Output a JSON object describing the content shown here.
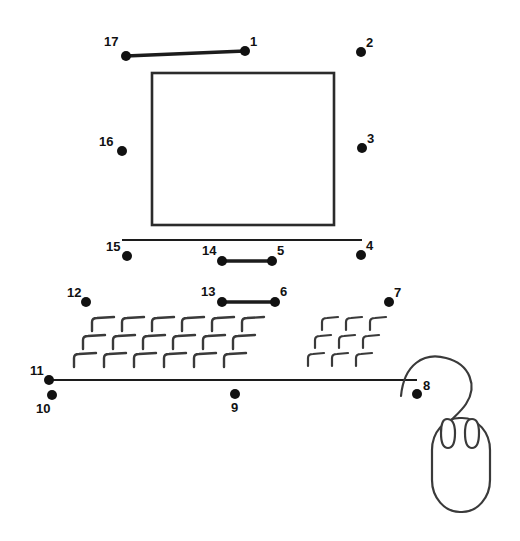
{
  "puzzle": {
    "type": "connect-the-dots",
    "subject": "desktop computer with monitor, keyboard and mouse",
    "dot_count": 17,
    "colors": {
      "ink": "#2b2b2b",
      "dot": "#111111",
      "paper": "#ffffff"
    },
    "dots": [
      {
        "number": "1",
        "cx": 245,
        "cy": 51,
        "label_x": 250,
        "label_y": 35
      },
      {
        "number": "2",
        "cx": 361,
        "cy": 52,
        "label_x": 366,
        "label_y": 36
      },
      {
        "number": "3",
        "cx": 362,
        "cy": 148,
        "label_x": 367,
        "label_y": 132
      },
      {
        "number": "4",
        "cx": 361,
        "cy": 255,
        "label_x": 366,
        "label_y": 239
      },
      {
        "number": "5",
        "cx": 272,
        "cy": 261,
        "label_x": 277,
        "label_y": 244
      },
      {
        "number": "6",
        "cx": 275,
        "cy": 302,
        "label_x": 280,
        "label_y": 285
      },
      {
        "number": "7",
        "cx": 389,
        "cy": 302,
        "label_x": 394,
        "label_y": 286
      },
      {
        "number": "8",
        "cx": 417,
        "cy": 394,
        "label_x": 423,
        "label_y": 379
      },
      {
        "number": "9",
        "cx": 235,
        "cy": 394,
        "label_x": 231,
        "label_y": 401
      },
      {
        "number": "10",
        "cx": 52,
        "cy": 395,
        "label_x": 36,
        "label_y": 402
      },
      {
        "number": "11",
        "cx": 49,
        "cy": 380,
        "label_x": 30,
        "label_y": 364
      },
      {
        "number": "12",
        "cx": 86,
        "cy": 302,
        "label_x": 67,
        "label_y": 286
      },
      {
        "number": "13",
        "cx": 222,
        "cy": 302,
        "label_x": 201,
        "label_y": 285
      },
      {
        "number": "14",
        "cx": 222,
        "cy": 261,
        "label_x": 202,
        "label_y": 244
      },
      {
        "number": "15",
        "cx": 127,
        "cy": 256,
        "label_x": 106,
        "label_y": 240
      },
      {
        "number": "16",
        "cx": 122,
        "cy": 151,
        "label_x": 99,
        "label_y": 135
      },
      {
        "number": "17",
        "cx": 126,
        "cy": 56,
        "label_x": 104,
        "label_y": 35
      }
    ],
    "dot_radius": 5,
    "drawn_segments": [
      {
        "name": "segment-17-to-1",
        "x1": 126,
        "y1": 56,
        "x2": 245,
        "y2": 51
      },
      {
        "name": "segment-14-to-5",
        "x1": 222,
        "y1": 261,
        "x2": 272,
        "y2": 261
      },
      {
        "name": "segment-13-to-6",
        "x1": 222,
        "y1": 302,
        "x2": 275,
        "y2": 302
      },
      {
        "name": "segment-11-to-8",
        "x1": 49,
        "y1": 380,
        "x2": 417,
        "y2": 380
      },
      {
        "name": "segment-15-to-4",
        "x1": 122,
        "y1": 240,
        "x2": 362,
        "y2": 240
      }
    ],
    "monitor_screen": {
      "x": 152,
      "y": 73,
      "width": 182,
      "height": 152
    },
    "keyboard": {
      "main_block": {
        "cols": 6,
        "rows": 3,
        "x": 92,
        "y": 318,
        "col_gap": 30,
        "row_gap": 18,
        "key_w": 22,
        "key_h": 13,
        "row_shift": -9
      },
      "keypad_block": {
        "cols": 3,
        "rows": 3,
        "x": 322,
        "y": 318,
        "col_gap": 24,
        "row_gap": 18,
        "key_w": 16,
        "key_h": 12,
        "row_shift": -7
      }
    },
    "mouse": {
      "body": {
        "x": 432,
        "y": 418,
        "width": 58,
        "height": 94,
        "radius": 28
      },
      "buttons": 2,
      "cable": true
    }
  }
}
